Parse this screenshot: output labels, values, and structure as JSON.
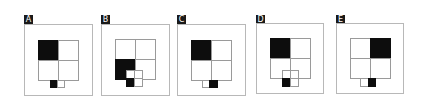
{
  "options": [
    {
      "label": "A",
      "grid_black": "top-left",
      "bottom": {
        "type": "pair",
        "black": "left"
      }
    },
    {
      "label": "B",
      "grid_black": "bottom-left",
      "bottom": {
        "type": "quad",
        "black": "bottom-left"
      }
    },
    {
      "label": "C",
      "grid_black": "top-left",
      "bottom": {
        "type": "pair",
        "black": "right"
      }
    },
    {
      "label": "D",
      "grid_black": "top-left",
      "bottom": {
        "type": "quad",
        "black": "bottom-left"
      }
    },
    {
      "label": "E",
      "grid_black": "top-right",
      "bottom": {
        "type": "pair",
        "black": "right"
      }
    }
  ],
  "colors": {
    "black": "#0d0d0d",
    "frame": "#b8b8b8",
    "grid_line": "#9a9a9a"
  }
}
